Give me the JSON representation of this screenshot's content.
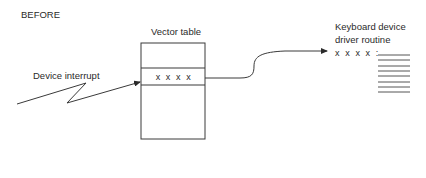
{
  "diagram": {
    "title": "BEFORE",
    "vector_table": {
      "label": "Vector table",
      "entry": "x x x x"
    },
    "interrupt": {
      "label": "Device interrupt"
    },
    "driver": {
      "label_line1": "Keyboard device",
      "label_line2": "driver routine",
      "entry": "x x x x :",
      "code_lines": 8
    },
    "colors": {
      "stroke": "#3a3a3a",
      "text": "#2a2a2a",
      "background": "#ffffff"
    }
  }
}
